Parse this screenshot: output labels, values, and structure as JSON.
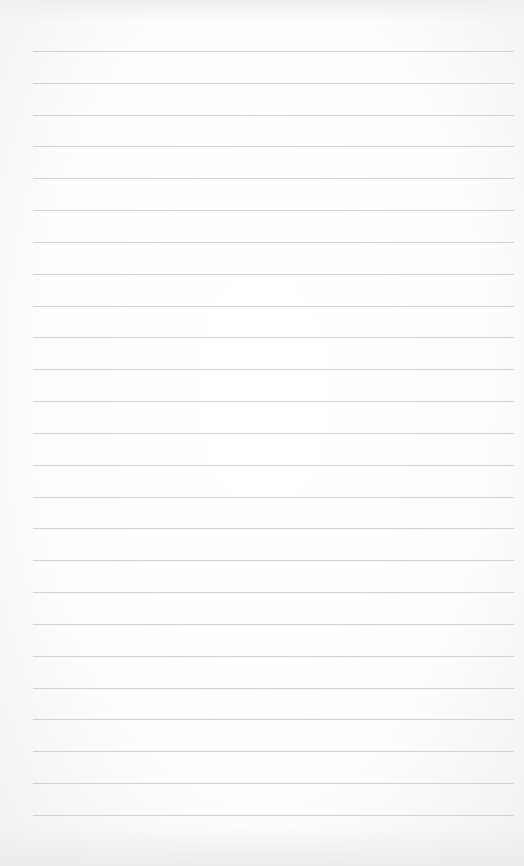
{
  "paper": {
    "kind": "lined-paper",
    "background_color": "#ffffff",
    "rule_color": "#c9c9c9",
    "rule_count": 25,
    "first_rule_y": 51,
    "rule_spacing": 31.83,
    "rule_left": 33,
    "rule_right": 514
  }
}
